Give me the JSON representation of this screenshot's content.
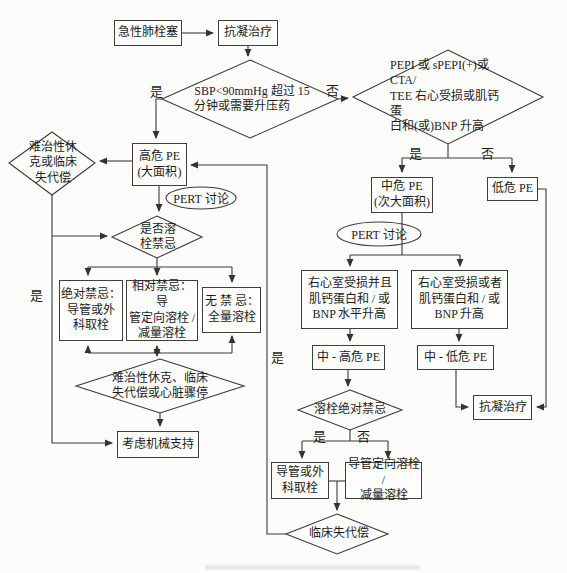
{
  "flowchart": {
    "nodes": {
      "acute_pe": "急性肺栓塞",
      "anticoag_top": "抗凝治疗",
      "sbp_decision": "SBP<90mmHg 超过 15\n分钟或需要升压药",
      "pepi_decision": "PEPI 或 sPEPI(+)或 CTA/\nTEE 右心受损或肌钙蛋\n白和(或)BNP 升高",
      "refractory_shock": "难治性休\n克或临床\n失代偿",
      "high_risk_pe": "高危 PE\n(大面积)",
      "pert_discussion_1": "PERT 讨论",
      "lysis_contraindication": "是否溶\n栓禁忌",
      "absolute_contra": "绝对禁忌：\n导管或外\n科取栓",
      "relative_contra": "相对禁忌：导\n管定向溶栓 /\n减量溶栓",
      "no_contra": "无 禁 忌：\n全量溶栓",
      "shock_arrest": "难治性休克、临床\n失代偿或心脏骤停",
      "mechanical_support": "考虑机械支持",
      "intermediate_risk_pe": "中危 PE\n(次大面积)",
      "low_risk_pe": "低危 PE",
      "pert_discussion_2": "PERT 讨论",
      "rv_injury_and": "右心室受损并且\n肌钙蛋白和 / 或\nBNP 水平升高",
      "rv_injury_or": "右心室受损或者\n肌钙蛋白和 / 或\nBNP 升高",
      "int_high_risk_pe": "中 - 高危 PE",
      "int_low_risk_pe": "中 - 低危 PE",
      "anticoag_bottom": "抗凝治疗",
      "catheter_surgical": "导管或外\n科取栓",
      "cdt_reduced_lysis": "导管定向溶栓 /\n减量溶栓",
      "clinical_decompensation": "临床失代偿"
    },
    "edge_labels": {
      "yes": "是",
      "no": "否"
    },
    "colors": {
      "line": "#3a3a3a",
      "text": "#1c1c1c",
      "background": "#fcfcfa"
    }
  }
}
